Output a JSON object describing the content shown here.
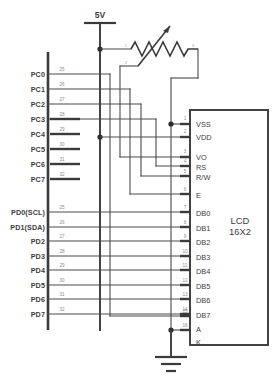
{
  "diagram": {
    "background_color": "#ffffff",
    "line_color": "#3a3a3a",
    "label_color": "#3d3d3d",
    "pin_number_color": "#8c8c8c"
  },
  "supply": {
    "label": "5V"
  },
  "potentiometer": {
    "terminal_left_label": "1",
    "terminal_right_label": "3",
    "terminal_wiper_label": "2"
  },
  "mcu": {
    "port_c": [
      {
        "label": "PC0",
        "pin": "25"
      },
      {
        "label": "PC1",
        "pin": "26"
      },
      {
        "label": "PC2",
        "pin": "27"
      },
      {
        "label": "PC3",
        "pin": "28"
      },
      {
        "label": "PC4",
        "pin": "29"
      },
      {
        "label": "PC5",
        "pin": "30"
      },
      {
        "label": "PC6",
        "pin": "31"
      },
      {
        "label": "PC7",
        "pin": "32"
      }
    ],
    "port_d": [
      {
        "label": "PD0(SCL)",
        "pin": "25"
      },
      {
        "label": "PD1(SDA)",
        "pin": "26"
      },
      {
        "label": "PD2",
        "pin": "27"
      },
      {
        "label": "PD3",
        "pin": "28"
      },
      {
        "label": "PD4",
        "pin": "29"
      },
      {
        "label": "PD5",
        "pin": "30"
      },
      {
        "label": "PD6",
        "pin": "31"
      },
      {
        "label": "PD7",
        "pin": "32"
      }
    ]
  },
  "lcd": {
    "title_line1": "LCD",
    "title_line2": "16X2",
    "pins": [
      {
        "num": "1",
        "label": "VSS"
      },
      {
        "num": "2",
        "label": "VDD"
      },
      {
        "num": "3",
        "label": "VO"
      },
      {
        "num": "4",
        "label": "RS"
      },
      {
        "num": "5",
        "label": "R/W"
      },
      {
        "num": "6",
        "label": "E"
      },
      {
        "num": "7",
        "label": "DB0"
      },
      {
        "num": "8",
        "label": "DB1"
      },
      {
        "num": "9",
        "label": "DB2"
      },
      {
        "num": "10",
        "label": "DB3"
      },
      {
        "num": "11",
        "label": "DB4"
      },
      {
        "num": "12",
        "label": "DB5"
      },
      {
        "num": "13",
        "label": "DB6"
      },
      {
        "num": "14",
        "label": "DB7"
      },
      {
        "num": "15",
        "label": "A"
      },
      {
        "num": "16",
        "label": "K"
      }
    ]
  }
}
